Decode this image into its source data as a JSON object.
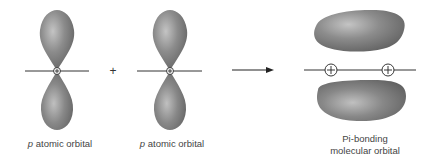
{
  "diagram": {
    "left_orbital": {
      "italic": "p",
      "label": " atomic orbital"
    },
    "operator": "+",
    "right_orbital": {
      "italic": "p",
      "label": " atomic orbital"
    },
    "arrow": "reaction-arrow",
    "result": {
      "line1": "Pi-bonding",
      "line2": "molecular orbital"
    },
    "nucleus_symbol": "+",
    "colors": {
      "lobe": "#7a7a7a",
      "lobe_highlight": "#b8b8b8",
      "line": "#333333",
      "text": "#444444"
    }
  }
}
